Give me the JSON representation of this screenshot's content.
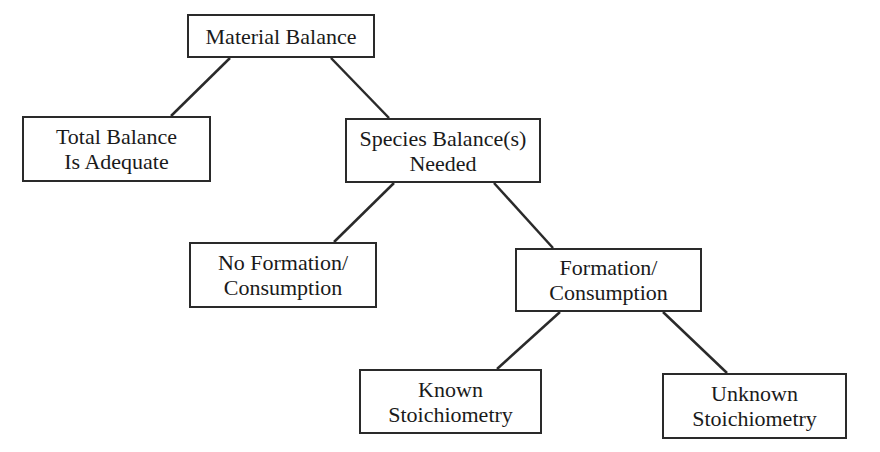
{
  "diagram": {
    "type": "tree",
    "nodes": [
      {
        "id": "material",
        "lines": [
          "Material Balance"
        ],
        "box": [
          187,
          14,
          188,
          44
        ]
      },
      {
        "id": "total",
        "lines": [
          "Total Balance",
          "Is Adequate"
        ],
        "box": [
          22,
          116,
          189,
          66
        ]
      },
      {
        "id": "species",
        "lines": [
          "Species Balance(s)",
          "Needed"
        ],
        "box": [
          345,
          118,
          196,
          65
        ]
      },
      {
        "id": "noformation",
        "lines": [
          "No Formation/",
          "Consumption"
        ],
        "box": [
          189,
          242,
          188,
          66
        ]
      },
      {
        "id": "formation",
        "lines": [
          "Formation/",
          "Consumption"
        ],
        "box": [
          515,
          248,
          187,
          64
        ]
      },
      {
        "id": "known",
        "lines": [
          "Known",
          "Stoichiometry"
        ],
        "box": [
          359,
          369,
          183,
          65
        ]
      },
      {
        "id": "unknown",
        "lines": [
          "Unknown",
          "Stoichiometry"
        ],
        "box": [
          662,
          373,
          185,
          66
        ]
      }
    ],
    "edges": [
      {
        "from": "material",
        "to": "total",
        "line": [
          230,
          58,
          171,
          116
        ]
      },
      {
        "from": "material",
        "to": "species",
        "line": [
          331,
          58,
          389,
          118
        ]
      },
      {
        "from": "species",
        "to": "noformation",
        "line": [
          394,
          183,
          334,
          242
        ]
      },
      {
        "from": "species",
        "to": "formation",
        "line": [
          494,
          183,
          553,
          248
        ]
      },
      {
        "from": "formation",
        "to": "known",
        "line": [
          560,
          312,
          497,
          369
        ]
      },
      {
        "from": "formation",
        "to": "unknown",
        "line": [
          663,
          312,
          727,
          373
        ]
      }
    ],
    "colors": {
      "stroke": "#2a2a2a",
      "background": "#ffffff",
      "text": "#1a1a1a"
    }
  }
}
